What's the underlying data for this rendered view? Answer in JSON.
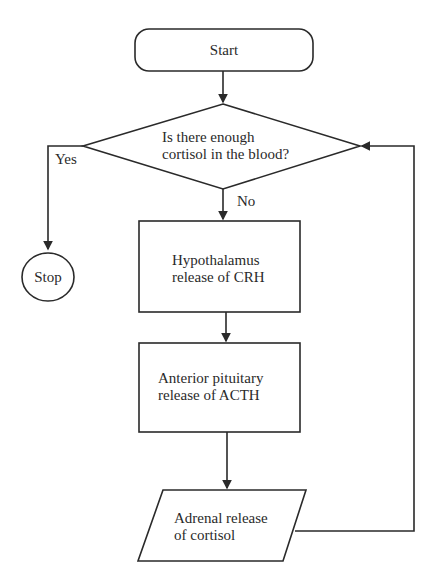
{
  "flowchart": {
    "start": {
      "label": "Start"
    },
    "decision": {
      "line1": "Is there enough",
      "line2": "cortisol in the blood?"
    },
    "yes_label": "Yes",
    "no_label": "No",
    "stop": {
      "label": "Stop"
    },
    "step1": {
      "line1": "Hypothalamus",
      "line2": "release of CRH"
    },
    "step2": {
      "line1": "Anterior pituitary",
      "line2": "release of ACTH"
    },
    "step3": {
      "line1": "Adrenal release",
      "line2": "of cortisol"
    }
  },
  "colors": {
    "stroke": "#2a2a2a",
    "background": "#ffffff"
  }
}
